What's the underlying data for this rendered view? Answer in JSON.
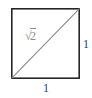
{
  "figure": {
    "kind": "geometry-diagram",
    "canvas": {
      "width": 92,
      "height": 98,
      "background_color": "#ffffff"
    },
    "square": {
      "name": "unit-square",
      "left": 11,
      "top": 8,
      "right": 80,
      "bottom": 79,
      "stroke_color": "#252525",
      "stroke_width": 1.6,
      "fill": "none"
    },
    "diagonal": {
      "name": "diagonal-line",
      "from": {
        "x": 11,
        "y": 79
      },
      "to": {
        "x": 80,
        "y": 8
      },
      "stroke_color": "#8a8a8a",
      "stroke_width": 1.1
    },
    "labels": {
      "hypotenuse": {
        "radical_sign": "√",
        "radicand": "2",
        "full_text": "√2",
        "color": "#8d8d8d"
      },
      "right_side": {
        "text": "1",
        "color": "#3b3b3b"
      },
      "bottom_side": {
        "text": "1",
        "color": "#3b3b3b"
      }
    }
  }
}
